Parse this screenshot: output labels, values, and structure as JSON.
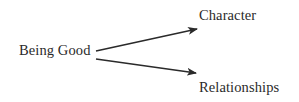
{
  "diagram": {
    "source": {
      "label": "Being Good"
    },
    "targets": [
      {
        "label": "Character"
      },
      {
        "label": "Relationships"
      }
    ],
    "edges": [
      {
        "from": "Being Good",
        "to": "Character"
      },
      {
        "from": "Being Good",
        "to": "Relationships"
      }
    ],
    "colors": {
      "text": "#2a2a2a",
      "arrow": "#2a2a2a",
      "background": "#ffffff"
    }
  }
}
